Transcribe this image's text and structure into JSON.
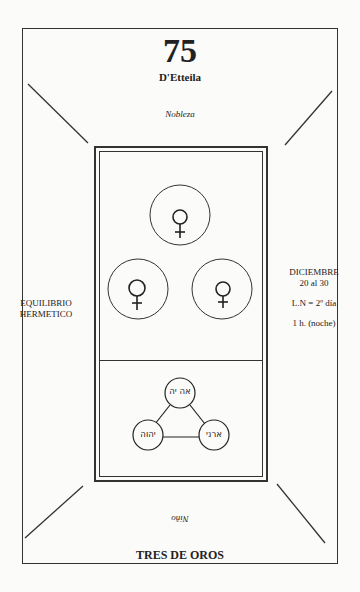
{
  "card": {
    "number": "75",
    "author": "D'Etteila",
    "top_meaning": "Nobleza",
    "left_caption": [
      "EQUILIBRIO",
      "HERMETICO"
    ],
    "right_caption": {
      "month": "DICIEMBRE",
      "dates": "20 al 30",
      "ln": "L.N = 2º día",
      "hour": "1 h. (noche)"
    },
    "reversed_meaning": "Niño",
    "name": "TRES DE OROS",
    "symbols": [
      {
        "name": "venus-icon",
        "glyph": "♀"
      },
      {
        "name": "venus-icon",
        "glyph": "♀"
      },
      {
        "name": "venus-icon",
        "glyph": "♀"
      }
    ],
    "hebrew_names": {
      "top": "אה יה",
      "left": "יהוה",
      "right": "ארני"
    }
  }
}
